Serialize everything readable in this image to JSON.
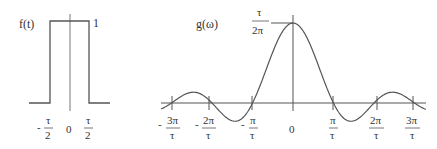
{
  "left_panel": {
    "function_label": "f(t)",
    "height_label": "1",
    "ticks": [
      {
        "sign": "-",
        "num": "τ",
        "den": "2"
      },
      {
        "plain": "0"
      },
      {
        "sign": "",
        "num": "τ",
        "den": "2"
      }
    ]
  },
  "right_panel": {
    "function_label": "g(ω)",
    "peak_label": {
      "num": "τ",
      "den": "2π"
    },
    "ticks": [
      {
        "sign": "-",
        "num": "3π",
        "den": "τ"
      },
      {
        "sign": "-",
        "num": "2π",
        "den": "τ"
      },
      {
        "sign": "-",
        "num": "π",
        "den": "τ"
      },
      {
        "plain": "0"
      },
      {
        "sign": "",
        "num": "π",
        "den": "τ"
      },
      {
        "sign": "",
        "num": "2π",
        "den": "τ"
      },
      {
        "sign": "",
        "num": "3π",
        "den": "τ"
      }
    ]
  },
  "colors": {
    "line": "#555555",
    "text": "#333333"
  }
}
